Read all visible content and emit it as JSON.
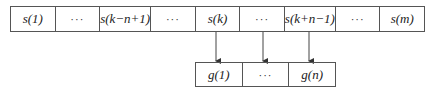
{
  "diagram": {
    "top_row": [
      "s(1)",
      "···",
      "s(k−n+1)",
      "···",
      "s(k)",
      "···",
      "s(k+n−1)",
      "···",
      "s(m)"
    ],
    "bottom_row": [
      "g(1)",
      "···",
      "g(n)"
    ],
    "arrows": [
      {
        "from": "s(k)",
        "to": "g(1)"
      },
      {
        "from": "···",
        "to": "···"
      },
      {
        "from": "s(k+n−1)",
        "to": "g(n)"
      }
    ],
    "colors": {
      "line": "#555555",
      "text": "#222222"
    }
  }
}
